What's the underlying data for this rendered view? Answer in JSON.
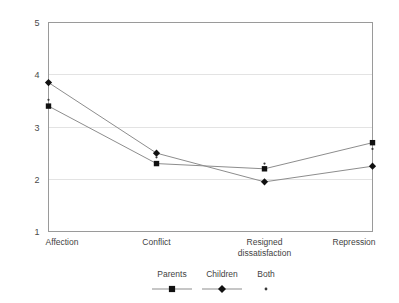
{
  "chart_data": {
    "type": "line",
    "title": "",
    "subtitle": "",
    "xlabel": "",
    "ylabel": "",
    "categories": [
      "Affection",
      "Conflict",
      "Resigned dissatisfaction",
      "Repression"
    ],
    "category_lines": [
      [
        "Affection"
      ],
      [
        "Conflict"
      ],
      [
        "Resigned",
        "dissatisfaction"
      ],
      [
        "Repression"
      ]
    ],
    "ylim": [
      1,
      5
    ],
    "yticks": [
      1,
      2,
      3,
      4,
      5
    ],
    "ytick_labels": [
      "1",
      "2",
      "3",
      "4",
      "5"
    ],
    "grid": true,
    "legend_position": "bottom",
    "series": [
      {
        "name": "Parents",
        "marker": "square",
        "values": [
          3.4,
          2.3,
          2.2,
          2.7
        ]
      },
      {
        "name": "Children",
        "marker": "diamond",
        "values": [
          3.85,
          2.5,
          1.95,
          2.25
        ]
      },
      {
        "name": "Both",
        "marker": "dot",
        "values": [
          3.52,
          2.42,
          2.3,
          2.58
        ]
      }
    ]
  },
  "legend": {
    "items": [
      {
        "label": "Parents",
        "marker": "square"
      },
      {
        "label": "Children",
        "marker": "diamond"
      },
      {
        "label": "Both",
        "marker": "dot"
      }
    ]
  }
}
